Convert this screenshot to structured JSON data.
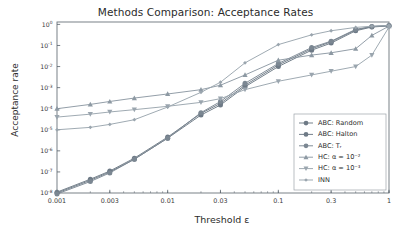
{
  "chart_data": {
    "type": "line",
    "title": "Methods Comparison: Acceptance Rates",
    "xlabel": "Threshold ε",
    "ylabel": "Acceptance rate",
    "xscale": "log",
    "yscale": "log",
    "xlim": [
      0.001,
      1.0
    ],
    "ylim": [
      1e-08,
      1.3
    ],
    "grid": false,
    "legend_position": "lower right",
    "xticks": [
      0.001,
      0.003,
      0.01,
      0.03,
      0.1,
      0.3,
      1
    ],
    "xtick_labels": [
      "0.001",
      "0.003",
      "0.01",
      "0.03",
      "0.1",
      "0.3",
      "1"
    ],
    "ytick_labels": [
      "10⁰",
      "10⁻¹",
      "10⁻²",
      "10⁻³",
      "10⁻⁴",
      "10⁻⁵",
      "10⁻⁶",
      "10⁻⁷",
      "10⁻⁸"
    ],
    "yticks": [
      1,
      0.1,
      0.01,
      0.001,
      0.0001,
      1e-05,
      1e-06,
      1e-07,
      1e-08
    ],
    "x": [
      0.001,
      0.002,
      0.003,
      0.005,
      0.01,
      0.02,
      0.03,
      0.05,
      0.1,
      0.2,
      0.3,
      0.5,
      0.7,
      1.0
    ],
    "series": [
      {
        "name": "ABC: Random",
        "marker": "circle",
        "color": "#6e7a86",
        "values": [
          1e-08,
          4e-08,
          1e-07,
          4e-07,
          4e-06,
          5e-05,
          0.00015,
          0.0011,
          0.01,
          0.06,
          0.13,
          0.5,
          0.75,
          0.85
        ]
      },
      {
        "name": "ABC: Halton",
        "marker": "circle",
        "color": "#6e7a86",
        "values": [
          1.1e-08,
          4.5e-08,
          1.1e-07,
          4.5e-07,
          4.5e-06,
          6e-05,
          0.00018,
          0.0013,
          0.012,
          0.07,
          0.15,
          0.55,
          0.78,
          0.87
        ]
      },
      {
        "name": "ABC: T_r",
        "marker": "circle",
        "color": "#7b8792",
        "values": [
          9e-09,
          3.5e-08,
          9e-08,
          4e-07,
          4e-06,
          6.5e-05,
          0.00022,
          0.0016,
          0.014,
          0.08,
          0.16,
          0.58,
          0.8,
          0.88
        ]
      },
      {
        "name": "HC: α = 10⁻²",
        "marker": "triangle-up",
        "color": "#8d99a3",
        "values": [
          0.0001,
          0.00016,
          0.00022,
          0.00032,
          0.0005,
          0.0008,
          0.0013,
          0.004,
          0.02,
          0.035,
          0.045,
          0.07,
          0.3,
          0.83
        ]
      },
      {
        "name": "HC: α = 10⁻³",
        "marker": "triangle-down",
        "color": "#9aa5ae",
        "values": [
          4e-05,
          5.5e-05,
          7e-05,
          9e-05,
          0.00013,
          0.0002,
          0.0003,
          0.0008,
          0.002,
          0.004,
          0.006,
          0.01,
          0.035,
          0.75
        ]
      },
      {
        "name": "INN",
        "marker": "diamond-small",
        "color": "#9aa5ae",
        "values": [
          1e-05,
          1.3e-05,
          1.8e-05,
          3e-05,
          0.00012,
          0.0006,
          0.0018,
          0.015,
          0.11,
          0.32,
          0.5,
          0.72,
          0.82,
          0.89
        ]
      }
    ]
  },
  "legend": {
    "entries": [
      {
        "label": "ABC: Random"
      },
      {
        "label": "ABC: Halton"
      },
      {
        "label": "ABC: Tᵣ"
      },
      {
        "label": "HC: α = 10⁻²"
      },
      {
        "label": "HC: α = 10⁻³"
      },
      {
        "label": "INN"
      }
    ]
  },
  "style": {
    "axis_color": "#555f68",
    "frame_color": "#6b737b",
    "text_color": "#2b2b2b",
    "background": "#ffffff"
  }
}
